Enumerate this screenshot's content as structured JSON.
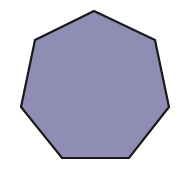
{
  "shape": {
    "type": "heptagon",
    "sides": 7,
    "fill": "#8f8db4",
    "stroke": "#1a1a1a",
    "stroke_width": 2.2,
    "points": "94,11 155,40 169,107 129,158 62,158 21,107 35,40"
  }
}
